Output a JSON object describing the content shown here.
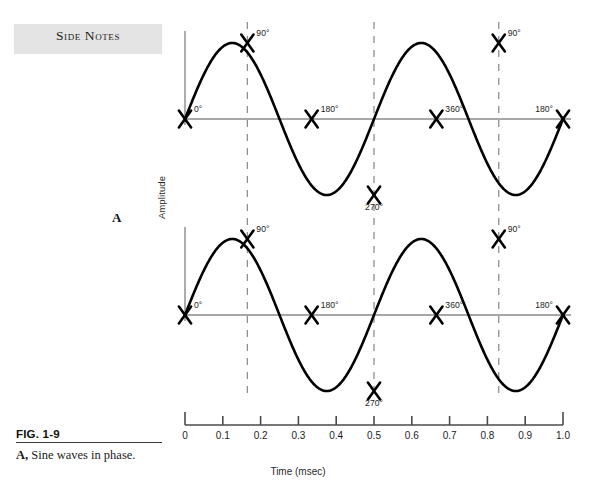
{
  "sidebar": {
    "header_label": "Side Notes"
  },
  "figure": {
    "panel_letter": "A",
    "number_label": "FIG. 1-9",
    "caption_bold": "A,",
    "caption_text": " Sine waves in phase."
  },
  "axes": {
    "y_label": "Amplitude",
    "x_label": "Time (msec)",
    "x_ticks": [
      "0",
      "0.1",
      "0.2",
      "0.3",
      "0.4",
      "0.5",
      "0.6",
      "0.7",
      "0.8",
      "0.9",
      "1.0"
    ]
  },
  "chart_data": {
    "type": "line",
    "title": "",
    "xlabel": "Time (msec)",
    "ylabel": "Amplitude",
    "xlim": [
      0,
      1.0
    ],
    "ylim": [
      -1,
      1
    ],
    "grid": false,
    "legend": "none",
    "series": [
      {
        "name": "Sine wave 1",
        "cycles": 2,
        "amplitude": 1,
        "phase_deg": 0,
        "marker": "x-cross",
        "baseline_y_px": 119,
        "peak_y_px": 43,
        "trough_y_px": 189,
        "markers": [
          {
            "label": "0°",
            "x": 0.0,
            "y": 0,
            "label_pos": "above-right"
          },
          {
            "label": "90°",
            "x": 0.165,
            "y": 1,
            "label_pos": "above-right"
          },
          {
            "label": "180°",
            "x": 0.335,
            "y": 0,
            "label_pos": "above-right"
          },
          {
            "label": "270°",
            "x": 0.5,
            "y": -1,
            "label_pos": "below"
          },
          {
            "label": "360°",
            "x": 0.665,
            "y": 0,
            "label_pos": "above-right"
          },
          {
            "label": "90°",
            "x": 0.83,
            "y": 1,
            "label_pos": "above-right"
          },
          {
            "label": "180°",
            "x": 1.0,
            "y": 0,
            "label_pos": "above-left"
          }
        ]
      },
      {
        "name": "Sine wave 2",
        "cycles": 2,
        "amplitude": 1,
        "phase_deg": 0,
        "marker": "x-cross",
        "baseline_y_px": 315,
        "peak_y_px": 239,
        "trough_y_px": 385,
        "markers": [
          {
            "label": "0°",
            "x": 0.0,
            "y": 0,
            "label_pos": "above-right"
          },
          {
            "label": "90°",
            "x": 0.165,
            "y": 1,
            "label_pos": "above-right"
          },
          {
            "label": "180°",
            "x": 0.335,
            "y": 0,
            "label_pos": "above-right"
          },
          {
            "label": "270°",
            "x": 0.5,
            "y": -1,
            "label_pos": "below"
          },
          {
            "label": "360°",
            "x": 0.665,
            "y": 0,
            "label_pos": "above-right"
          },
          {
            "label": "90°",
            "x": 0.83,
            "y": 1,
            "label_pos": "above-right"
          },
          {
            "label": "180°",
            "x": 1.0,
            "y": 0,
            "label_pos": "above-left"
          }
        ]
      }
    ],
    "reference_lines": [
      {
        "label": "90° reference",
        "x": 0.165,
        "style": "dashed"
      },
      {
        "label": "270° reference",
        "x": 0.5,
        "style": "dashed"
      },
      {
        "label": "90° reference (2nd cycle)",
        "x": 0.83,
        "style": "dashed"
      }
    ]
  },
  "colors": {
    "band": "#e4e4e4",
    "wave": "#000000",
    "baseline": "#8a8a8a",
    "dashed": "#8f8f8f",
    "text": "#1a1a1a"
  }
}
